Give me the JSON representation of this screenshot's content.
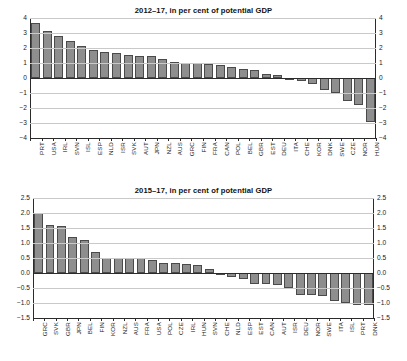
{
  "charts": [
    {
      "id": "top",
      "title": "2012–17, in per cent of potential GDP",
      "yticks": [
        "4",
        "3",
        "2",
        "1",
        "0",
        "−1",
        "−2",
        "−3",
        "−4"
      ]
    },
    {
      "id": "bottom",
      "title": "2015–17, in per cent of potential GDP",
      "yticks": [
        "2.5",
        "2.0",
        "1.5",
        "1.0",
        "0.5",
        "0.0",
        "−0.5",
        "−1.0",
        "−1.5"
      ]
    }
  ],
  "chart_data": [
    {
      "type": "bar",
      "title": "2012–17, in per cent of potential GDP",
      "xlabel": "",
      "ylabel": "",
      "ylim": [
        -4,
        4
      ],
      "ytick_values": [
        4,
        3,
        2,
        1,
        0,
        -1,
        -2,
        -3,
        -4
      ],
      "grid": true,
      "legend": "none",
      "axis_labels_both_sides": true,
      "bar_color": "#8e8e8e",
      "bar_edge_color": "#4a4a4a",
      "categories": [
        "PRT",
        "USA",
        "IRL",
        "SVN",
        "ISL",
        "ESP",
        "NLD",
        "ISR",
        "SVK",
        "AUT",
        "JPN",
        "NZL",
        "AUS",
        "GRC",
        "FIN",
        "FRA",
        "CAN",
        "POL",
        "BEL",
        "GBR",
        "EST",
        "DEU",
        "ITA",
        "CHE",
        "KOR",
        "DNK",
        "SWE",
        "CZE",
        "NOR",
        "HUN"
      ],
      "values": [
        3.65,
        3.15,
        2.8,
        2.45,
        2.15,
        1.85,
        1.75,
        1.7,
        1.55,
        1.5,
        1.45,
        1.25,
        1.1,
        1.0,
        0.98,
        0.95,
        0.9,
        0.72,
        0.58,
        0.55,
        0.27,
        0.22,
        0.03,
        -0.22,
        -0.38,
        -0.78,
        -1.0,
        -1.55,
        -1.8,
        -2.95
      ]
    },
    {
      "type": "bar",
      "title": "2015–17, in per cent of potential GDP",
      "xlabel": "",
      "ylabel": "",
      "ylim": [
        -1.5,
        2.5
      ],
      "ytick_values": [
        2.5,
        2.0,
        1.5,
        1.0,
        0.5,
        0.0,
        -0.5,
        -1.0,
        -1.5
      ],
      "grid": true,
      "legend": "none",
      "axis_labels_both_sides": true,
      "bar_color": "#8e8e8e",
      "bar_edge_color": "#4a4a4a",
      "categories": [
        "GRC",
        "SVK",
        "GBR",
        "JPN",
        "BEL",
        "FIN",
        "KOR",
        "NZL",
        "AUS",
        "FRA",
        "USA",
        "POL",
        "CZE",
        "IRL",
        "HUN",
        "SVN",
        "CHE",
        "NLD",
        "ESP",
        "EST",
        "CAN",
        "AUT",
        "ISR",
        "DEU",
        "NOR",
        "SWE",
        "ITA",
        "ISL",
        "PRT",
        "DNK"
      ],
      "values": [
        1.99,
        1.6,
        1.57,
        1.19,
        1.1,
        0.7,
        0.51,
        0.51,
        0.49,
        0.49,
        0.43,
        0.33,
        0.32,
        0.3,
        0.26,
        0.12,
        -0.06,
        -0.14,
        -0.19,
        -0.37,
        -0.37,
        -0.41,
        -0.5,
        -0.72,
        -0.72,
        -0.77,
        -0.94,
        -1.0,
        -1.06,
        -1.06
      ]
    }
  ]
}
